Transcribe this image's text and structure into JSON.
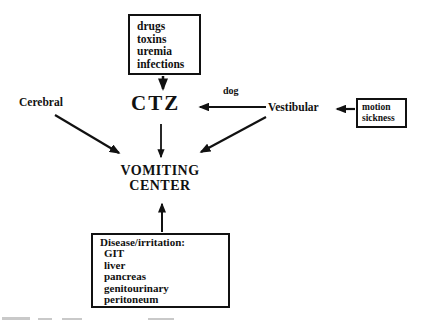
{
  "diagram": {
    "colors": {
      "ink": "#111111",
      "background": "#ffffff"
    },
    "causes_box": {
      "lines": [
        "drugs",
        "toxins",
        "uremia",
        "infections"
      ]
    },
    "ctz_label": "CTZ",
    "cerebral_label": "Cerebral",
    "vestibular_label": "Vestibular",
    "dog_arrow_label": "dog",
    "motion_box": {
      "lines": [
        "motion",
        "sickness"
      ]
    },
    "vomiting_center": {
      "line1": "VOMITING",
      "line2": "CENTER"
    },
    "disease_box": {
      "title": "Disease/irritation:",
      "items": [
        "GIT",
        "liver",
        "pancreas",
        "genitourinary",
        "peritoneum"
      ]
    }
  }
}
